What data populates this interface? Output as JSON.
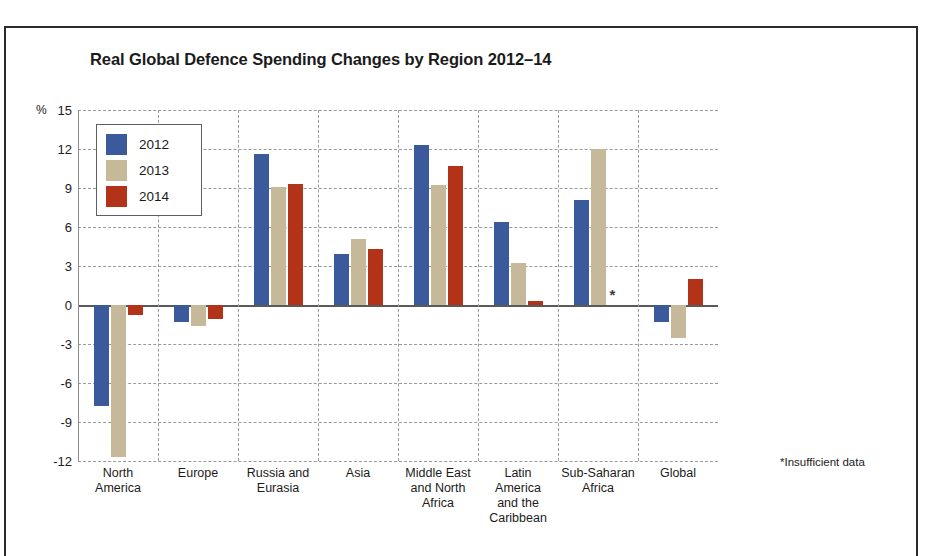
{
  "chart_data": {
    "type": "bar",
    "title": "Real Global Defence Spending Changes by Region 2012–14",
    "xlabel": "",
    "ylabel": "%",
    "unit_label": "%",
    "ylim": [
      -12,
      15
    ],
    "yticks": [
      15,
      12,
      9,
      6,
      3,
      0,
      -3,
      -6,
      -9,
      -12
    ],
    "ytick_labels": [
      "15",
      "12",
      "9",
      "6",
      "3",
      "0",
      "-3",
      "-6",
      "-9",
      "-12"
    ],
    "grid": true,
    "legend_position": "upper-left",
    "categories": [
      "North America",
      "Europe",
      "Russia and Eurasia",
      "Asia",
      "Middle East and North Africa",
      "Latin America and the Caribbean",
      "Sub-Saharan Africa",
      "Global"
    ],
    "category_label_lines": [
      [
        "North",
        "America"
      ],
      [
        "Europe"
      ],
      [
        "Russia and",
        "Eurasia"
      ],
      [
        "Asia"
      ],
      [
        "Middle East",
        "and North",
        "Africa"
      ],
      [
        "Latin",
        "America",
        "and the",
        "Caribbean"
      ],
      [
        "Sub-Saharan",
        "Africa"
      ],
      [
        "Global"
      ]
    ],
    "series": [
      {
        "name": "2012",
        "color": "#3a5a9b",
        "values": [
          -7.8,
          -1.3,
          11.6,
          3.9,
          12.3,
          6.4,
          8.1,
          -1.3
        ]
      },
      {
        "name": "2013",
        "color": "#c5b999",
        "values": [
          -11.7,
          -1.6,
          9.1,
          5.1,
          9.2,
          3.2,
          12.0,
          -2.5
        ]
      },
      {
        "name": "2014",
        "color": "#b23318",
        "values": [
          -0.8,
          -1.1,
          9.3,
          4.3,
          10.7,
          0.3,
          null,
          2.0
        ]
      }
    ],
    "annotations": [
      {
        "text": "*",
        "category": "Sub-Saharan Africa",
        "series": "2014",
        "meaning": "Insufficient data"
      }
    ],
    "footnote": "*Insufficient data"
  },
  "legend": {
    "items": [
      {
        "label": "2012",
        "color": "#3a5a9b"
      },
      {
        "label": "2013",
        "color": "#c5b999"
      },
      {
        "label": "2014",
        "color": "#b23318"
      }
    ]
  }
}
